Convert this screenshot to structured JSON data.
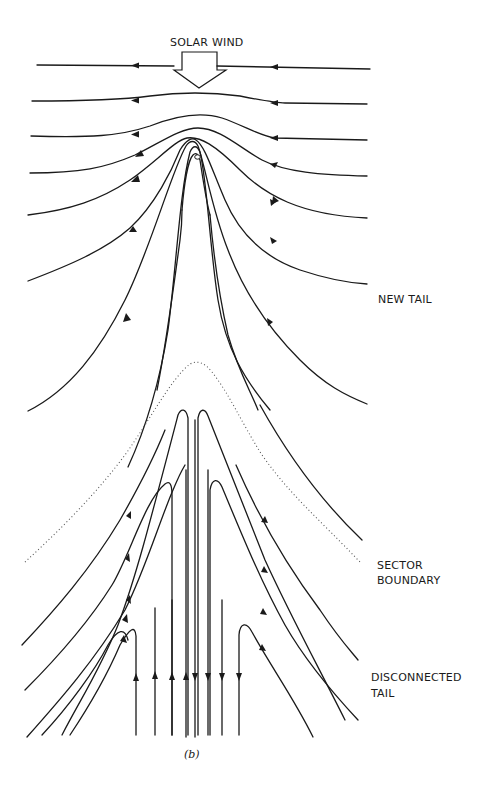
{
  "figure": {
    "panel_label": "(b)",
    "colors": {
      "ink": "#1a1a1a",
      "background": "#ffffff",
      "sector_boundary": "#555555"
    }
  },
  "labels": {
    "solar_wind": "SOLAR WIND",
    "new_tail": "NEW TAIL",
    "sector_boundary_line1": "SECTOR",
    "sector_boundary_line2": "BOUNDARY",
    "disconnected_tail_line1": "DISCONNECTED",
    "disconnected_tail_line2": "TAIL"
  },
  "elements": {
    "solar_wind_arrow": "block-down-arrow",
    "nucleus": "small-open-circle",
    "upstream_field_lines": 5,
    "new_tail_field_lines_per_side": 5,
    "disconnected_tail_lines_per_side": 4,
    "disconnected_vertical_lines": 8,
    "sector_boundary_style": "dotted"
  }
}
